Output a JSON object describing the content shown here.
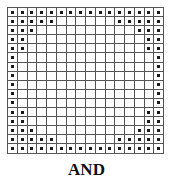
{
  "figure": {
    "label": "AND",
    "rows": 16,
    "cols": 16,
    "filled_per_side_by_row": [
      16,
      5,
      3,
      2,
      2,
      1,
      1,
      1,
      1,
      1,
      1,
      2,
      2,
      3,
      5,
      16
    ],
    "colors": {
      "grid_line": "#555555",
      "dot": "#1a1a1a",
      "background": "#ffffff"
    }
  }
}
